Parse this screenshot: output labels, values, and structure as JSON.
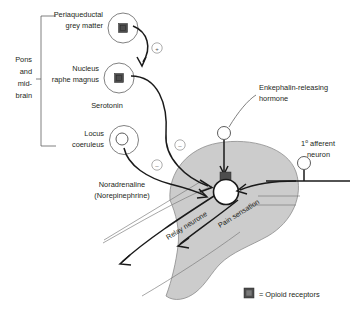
{
  "figure": {
    "background": "#ffffff",
    "grey_matter_fill": "#cccccc",
    "receptor_color": "#4d4d4d",
    "line_color": "#1a1a1a"
  },
  "brain_region": {
    "bracket_label_lines": [
      "Pons",
      "and",
      "mid-",
      "brain"
    ],
    "nuclei": [
      {
        "id": "pag",
        "label_lines": [
          "Periaqueductal",
          "grey matter"
        ],
        "has_opioid_receptor": true
      },
      {
        "id": "nrm",
        "label_lines": [
          "Nucleus",
          "raphe magnus"
        ],
        "has_opioid_receptor": true
      },
      {
        "id": "lc",
        "label_lines": [
          "Locus",
          "coeruleus"
        ],
        "has_opioid_receptor": false
      }
    ]
  },
  "transmitters": {
    "serotonin": "Serotonin",
    "noradrenaline_lines": [
      "Noradrenaline",
      "(Norepinephrine)"
    ]
  },
  "signs": [
    {
      "id": "excitatory-pag-to-nrm",
      "symbol": "+"
    },
    {
      "id": "inhibitory-serotonin",
      "symbol": "–"
    },
    {
      "id": "inhibitory-noradrenaline",
      "symbol": "–"
    }
  ],
  "spinal_cord": {
    "enkephalin_label_lines": [
      "Enkephalin-releasing",
      "hormone"
    ],
    "afferent_label_prefix": "1",
    "afferent_label_sup": "o",
    "afferent_label_rest": " afferent",
    "afferent_label_line2": "neuron",
    "tracts": [
      {
        "id": "relay-neurone",
        "label": "Relay neurone"
      },
      {
        "id": "pain-sensation",
        "label": "Pain sensation"
      }
    ]
  },
  "legend": {
    "symbol": "square",
    "text": "= Opioid receptors"
  }
}
